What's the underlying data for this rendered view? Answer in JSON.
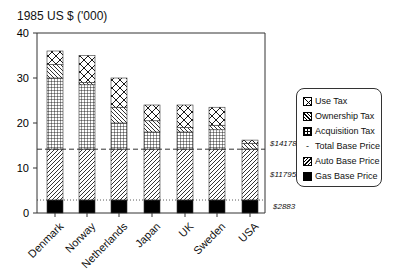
{
  "chart_data": {
    "type": "bar",
    "stacked": true,
    "title": "",
    "ylabel": "1985 US $ ('000)",
    "xlabel": "",
    "ylim": [
      0,
      40
    ],
    "yticks": [
      0,
      10,
      20,
      30,
      40
    ],
    "categories": [
      "Denmark",
      "Norway",
      "Netherlands",
      "Japan",
      "UK",
      "Sweden",
      "USA"
    ],
    "series": [
      {
        "name": "Gas Base Price",
        "values": [
          2.9,
          2.9,
          2.9,
          2.9,
          2.9,
          2.9,
          2.9
        ]
      },
      {
        "name": "Auto Base Price",
        "values": [
          11.3,
          11.3,
          11.3,
          11.3,
          11.3,
          11.3,
          11.3
        ]
      },
      {
        "name": "Acquisition Tax",
        "values": [
          15.8,
          14.3,
          5.8,
          3.8,
          3.8,
          4.3,
          0.0
        ]
      },
      {
        "name": "Ownership Tax",
        "values": [
          3.0,
          0.5,
          3.5,
          2.5,
          1.0,
          1.0,
          1.3
        ]
      },
      {
        "name": "Use Tax",
        "values": [
          3.0,
          6.0,
          6.5,
          3.5,
          5.0,
          4.0,
          0.7
        ]
      }
    ],
    "totals": [
      36,
      35,
      30,
      24,
      24,
      23.5,
      16.2
    ],
    "reference_lines": [
      {
        "name": "Total Base Price",
        "value": 14.178,
        "style": "dashed",
        "label": "$14178"
      },
      {
        "name": "Gas Base Price",
        "value": 2.883,
        "style": "dotted",
        "label": "$2883"
      }
    ],
    "annotations": [
      "$14178",
      "$11795",
      "$2883"
    ],
    "legend_position": "right",
    "grid": false
  },
  "header": {
    "ylabel": "1985 US $ ('000)"
  },
  "axis": {
    "yticks": [
      "0",
      "10",
      "20",
      "30",
      "40"
    ]
  },
  "categories": [
    "Denmark",
    "Norway",
    "Netherlands",
    "Japan",
    "UK",
    "Sweden",
    "USA"
  ],
  "annotations": {
    "total_base": "$14178",
    "auto_base": "$11795",
    "gas_base": "$2883"
  },
  "legend": [
    {
      "label": "Use Tax",
      "pattern": "crosshatch-diamond"
    },
    {
      "label": "Ownership Tax",
      "pattern": "diagonal-back"
    },
    {
      "label": "Acquisition Tax",
      "pattern": "grid"
    },
    {
      "label": "Total Base Price",
      "pattern": "dash"
    },
    {
      "label": "Auto Base Price",
      "pattern": "diagonal"
    },
    {
      "label": "Gas Base Price",
      "pattern": "solid-black"
    }
  ]
}
